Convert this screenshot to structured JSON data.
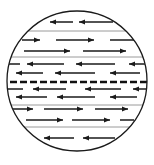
{
  "diagram": {
    "title": "",
    "colors": {
      "outline": "#1a1a1a",
      "arrow": "#1a1a1a",
      "separator": "#9a9a9a",
      "boundary": "#111111"
    },
    "bands": [
      {
        "name": "band-1",
        "rows": [
          {
            "direction": "left",
            "count": 2
          }
        ]
      },
      {
        "name": "band-2",
        "rows": [
          {
            "direction": "right",
            "count": 3
          },
          {
            "direction": "right",
            "count": 2
          }
        ]
      },
      {
        "name": "band-3",
        "rows": [
          {
            "direction": "left",
            "count": 4
          },
          {
            "direction": "left",
            "count": 3
          }
        ]
      },
      {
        "name": "band-4",
        "rows": [
          {
            "direction": "left",
            "count": 4
          },
          {
            "direction": "left",
            "count": 3
          }
        ]
      },
      {
        "name": "band-5",
        "rows": [
          {
            "direction": "right",
            "count": 3
          },
          {
            "direction": "right",
            "count": 3
          }
        ]
      },
      {
        "name": "band-6",
        "rows": [
          {
            "direction": "left",
            "count": 2
          }
        ]
      }
    ],
    "boundary_style": "dashed"
  }
}
